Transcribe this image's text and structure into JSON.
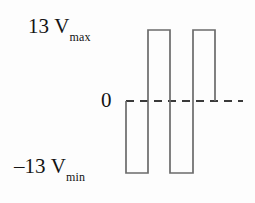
{
  "figure": {
    "background_color": "#fdfdfd",
    "stroke_color": "#6b6b6b",
    "text_color": "#141414"
  },
  "labels": {
    "max": {
      "value": "13",
      "unit": "V",
      "subscript": "max"
    },
    "zero": {
      "value": "0"
    },
    "min": {
      "value": "–13",
      "unit": "V",
      "subscript": "min"
    }
  },
  "chart_data": {
    "type": "line",
    "title": "",
    "xlabel": "",
    "ylabel": "",
    "ylim": [
      -13,
      13
    ],
    "grid": false,
    "legend": null,
    "tick_labels": [
      "13 Vmax",
      "0",
      "-13 Vmin"
    ],
    "annotations": [
      "13 Vmax",
      "0",
      "-13 Vmin"
    ],
    "zero_line": {
      "value": 0,
      "style": "dashed",
      "color": "#3a3a3a",
      "x_start_px": 126,
      "x_end_px": 243
    },
    "waveform": {
      "name": "square-wave",
      "description": "Square wave alternating between -13 V and +13 V, starting at 0, first excursion negative.",
      "levels": [
        0,
        -13,
        13,
        -13,
        13,
        0
      ],
      "points_px": [
        [
          126,
          101
        ],
        [
          126,
          173
        ],
        [
          148,
          173
        ],
        [
          148,
          30
        ],
        [
          170,
          30
        ],
        [
          170,
          173
        ],
        [
          193,
          173
        ],
        [
          193,
          30
        ],
        [
          215,
          30
        ],
        [
          215,
          101
        ]
      ],
      "x_px": [
        126,
        148,
        170,
        193,
        215
      ],
      "y_px": {
        "max": 30,
        "zero": 101,
        "min": 173
      }
    }
  }
}
